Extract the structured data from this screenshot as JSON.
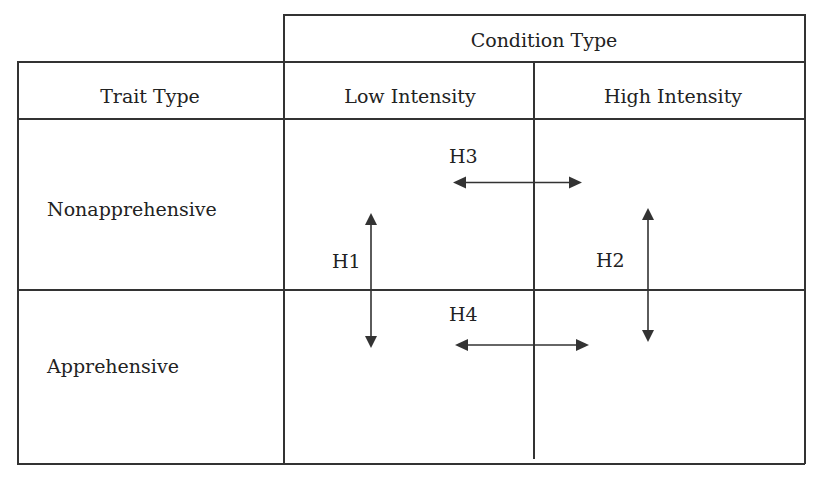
{
  "table": {
    "spanning_header": "Condition Type",
    "row_header_label": "Trait Type",
    "columns": [
      "Low Intensity",
      "High Intensity"
    ],
    "rows": [
      "Nonapprehensive",
      "Apprehensive"
    ]
  },
  "hypotheses": [
    {
      "label": "H1",
      "direction": "vertical",
      "between": [
        "Nonapprehensive",
        "Apprehensive"
      ],
      "column": "Low Intensity"
    },
    {
      "label": "H2",
      "direction": "vertical",
      "between": [
        "Nonapprehensive",
        "Apprehensive"
      ],
      "column": "High Intensity"
    },
    {
      "label": "H3",
      "direction": "horizontal",
      "between": [
        "Low Intensity",
        "High Intensity"
      ],
      "row": "Nonapprehensive"
    },
    {
      "label": "H4",
      "direction": "horizontal",
      "between": [
        "Low Intensity",
        "High Intensity"
      ],
      "row": "Apprehensive"
    }
  ],
  "colors": {
    "line": "#333333",
    "text": "#222222",
    "background": "#ffffff"
  }
}
